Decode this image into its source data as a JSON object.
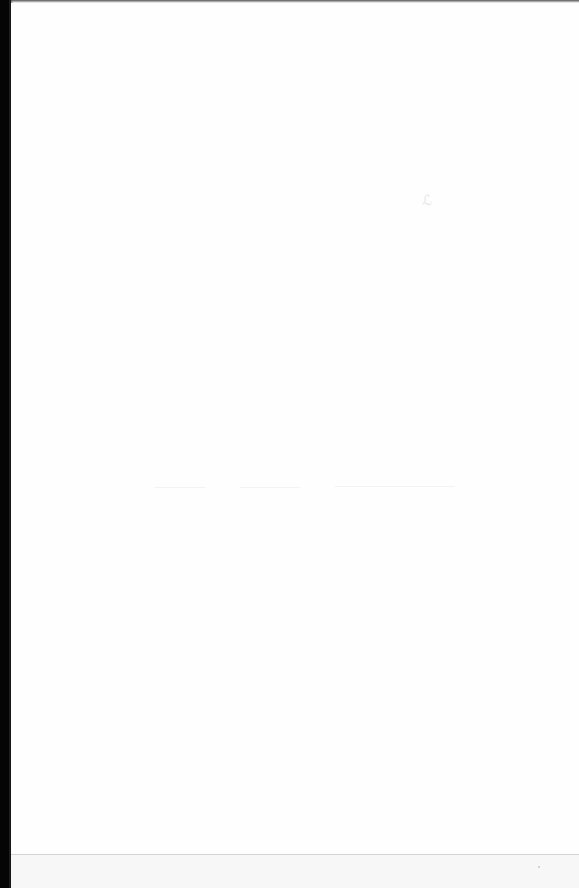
{
  "document": {
    "type": "scanned-blank-page",
    "text_content": "",
    "bleed_through_mark": "ℒ",
    "colors": {
      "paper": "#fefefe",
      "scan_border": "#050505",
      "fold_line": "#d4d4d4"
    }
  }
}
